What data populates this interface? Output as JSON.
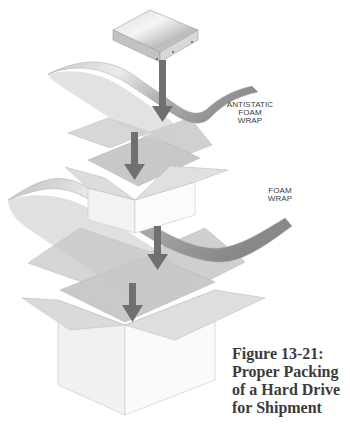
{
  "figure": {
    "caption_lines": [
      "Figure 13-21:",
      "Proper Packing",
      "of a Hard Drive",
      "for Shipment"
    ],
    "labels": {
      "antistatic_foam_wrap": [
        "ANTISTATIC",
        "FOAM",
        "WRAP"
      ],
      "foam_wrap": [
        "FOAM",
        "WRAP"
      ]
    },
    "components": [
      "hard-drive",
      "antistatic-foam-wrap",
      "inner-box",
      "foam-wrap",
      "outer-box"
    ],
    "colors": {
      "arrow": "#6e6e6e",
      "wrap_light": "#e6e6e6",
      "wrap_dark": "#9a9a9a",
      "box_face": "#f2f2f2",
      "box_flap": "#d4d4d4",
      "text": "#3b3b3b"
    }
  }
}
